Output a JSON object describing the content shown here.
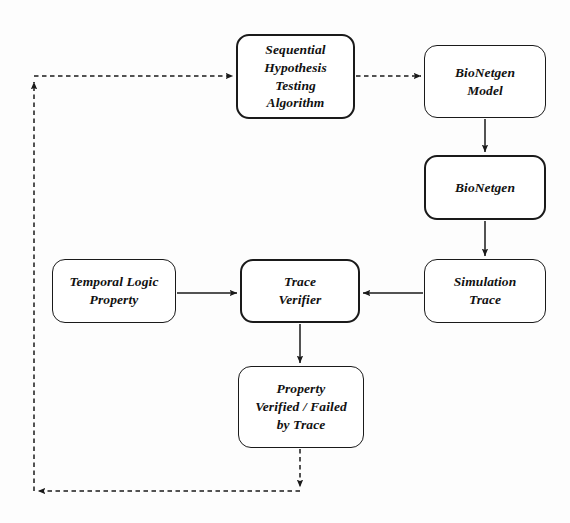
{
  "diagram": {
    "background_color": "#fdfdfd",
    "stroke_color": "#1a1a1a",
    "nodes": [
      {
        "id": "sht",
        "name": "sequential-hypothesis-testing-algorithm",
        "lines": [
          "Sequential",
          "Hypothesis",
          "Testing",
          "Algorithm"
        ],
        "x": 236,
        "y": 34,
        "w": 119,
        "h": 85,
        "weight": "heavy"
      },
      {
        "id": "bng_model",
        "name": "bionetgen-model",
        "lines": [
          "BioNetgen",
          "Model"
        ],
        "x": 424,
        "y": 45,
        "w": 122,
        "h": 73,
        "weight": "normal"
      },
      {
        "id": "bng",
        "name": "bionetgen",
        "lines": [
          "BioNetgen"
        ],
        "x": 424,
        "y": 155,
        "w": 122,
        "h": 65,
        "weight": "heavy"
      },
      {
        "id": "sim_trace",
        "name": "simulation-trace",
        "lines": [
          "Simulation",
          "Trace"
        ],
        "x": 424,
        "y": 259,
        "w": 122,
        "h": 64,
        "weight": "normal"
      },
      {
        "id": "tl_property",
        "name": "temporal-logic-property",
        "lines": [
          "Temporal Logic",
          "Property"
        ],
        "x": 52,
        "y": 259,
        "w": 124,
        "h": 64,
        "weight": "normal"
      },
      {
        "id": "trace_verifier",
        "name": "trace-verifier",
        "lines": [
          "Trace",
          "Verifier"
        ],
        "x": 240,
        "y": 259,
        "w": 120,
        "h": 64,
        "weight": "heavy"
      },
      {
        "id": "property_result",
        "name": "property-verified-failed-by-trace",
        "lines": [
          "Property",
          "Verified / Failed",
          "by Trace"
        ],
        "x": 238,
        "y": 366,
        "w": 126,
        "h": 82,
        "weight": "normal"
      }
    ],
    "edges": [
      {
        "id": "e_sht_to_model",
        "name": "edge-sht-to-bionetgen-model",
        "style": "dashed",
        "label": ""
      },
      {
        "id": "e_model_to_bng",
        "name": "edge-bionetgen-model-to-bionetgen",
        "style": "solid",
        "label": ""
      },
      {
        "id": "e_bng_to_trace",
        "name": "edge-bionetgen-to-simulation-trace",
        "style": "solid",
        "label": ""
      },
      {
        "id": "e_trace_to_verifier",
        "name": "edge-simulation-trace-to-trace-verifier",
        "style": "solid",
        "label": ""
      },
      {
        "id": "e_property_to_verifier",
        "name": "edge-temporal-logic-property-to-trace-verifier",
        "style": "solid",
        "label": ""
      },
      {
        "id": "e_verifier_to_result",
        "name": "edge-trace-verifier-to-property-result",
        "style": "solid",
        "label": ""
      },
      {
        "id": "e_feedback",
        "name": "edge-feedback-result-to-sht",
        "style": "dashed",
        "label": ""
      }
    ]
  }
}
